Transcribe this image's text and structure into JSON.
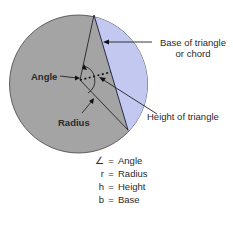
{
  "figure": {
    "colors": {
      "circle_fill": "#a4a4a4",
      "segment_fill": "#c2c8f0",
      "stroke": "#333333",
      "background": "#ffffff"
    },
    "labels": {
      "base": [
        "Base of triangle",
        "or chord"
      ],
      "angle": "Angle",
      "height": "Height of triangle",
      "radius": "Radius"
    }
  },
  "legend": [
    {
      "symbol": "∠",
      "eq": "=",
      "meaning": "Angle"
    },
    {
      "symbol": "r",
      "eq": "=",
      "meaning": "Radius"
    },
    {
      "symbol": "h",
      "eq": "=",
      "meaning": "Height"
    },
    {
      "symbol": "b",
      "eq": "=",
      "meaning": "Base"
    }
  ]
}
